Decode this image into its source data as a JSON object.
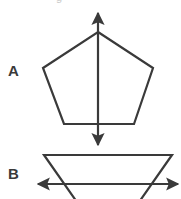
{
  "figure": {
    "title_clipped": "g",
    "background_color": "#ffffff",
    "stroke_color": "#3a3a3a",
    "label_color": "#3a3a3a",
    "stroke_width": 2.2,
    "width": 181,
    "height": 199
  },
  "panels": [
    {
      "id": "panel-a",
      "label": "A",
      "label_x": 8,
      "label_y": 63,
      "shape": {
        "name": "pentagon",
        "type": "polygon",
        "points": "98,32 153,68 134,124 64,124 43,68"
      },
      "symmetry_line": {
        "name": "vertical-symmetry-axis",
        "orientation": "vertical",
        "x1": 98,
        "y1": 13,
        "x2": 98,
        "y2": 145,
        "arrowheads": "both",
        "crosses_shape": true
      }
    },
    {
      "id": "panel-b",
      "label": "B",
      "label_x": 8,
      "label_y": 166,
      "shape": {
        "name": "trapezoid",
        "type": "polygon",
        "points": "44,155 172,155 137,205 79,205"
      },
      "symmetry_line": {
        "name": "horizontal-axis-line",
        "orientation": "horizontal",
        "x1": 38,
        "y1": 184,
        "x2": 178,
        "y2": 184,
        "arrowheads": "both",
        "crosses_shape": true
      }
    }
  ]
}
